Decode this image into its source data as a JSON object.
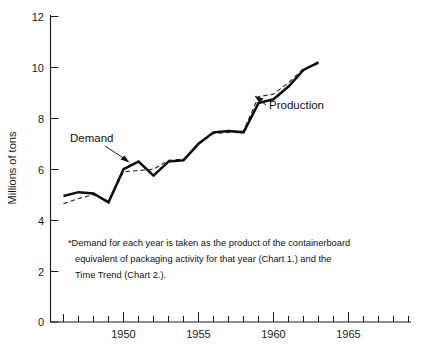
{
  "chart_data": {
    "type": "line",
    "title": "",
    "xlabel": "",
    "ylabel": "Millions of tons",
    "xlim": [
      1946,
      1969
    ],
    "ylim": [
      0,
      12
    ],
    "y_ticks": [
      0,
      2,
      4,
      6,
      8,
      10,
      12
    ],
    "y_tick_labels": [
      "0",
      "2",
      "4",
      "6",
      "8",
      "10",
      "12"
    ],
    "x_ticks": [
      1946,
      1947,
      1948,
      1949,
      1950,
      1951,
      1952,
      1953,
      1954,
      1955,
      1956,
      1957,
      1958,
      1959,
      1960,
      1961,
      1962,
      1963,
      1964,
      1965,
      1966,
      1967,
      1968,
      1969
    ],
    "x_tick_labels_shown": [
      "1950",
      "1955",
      "1960",
      "1965"
    ],
    "x_labeled_ticks": [
      1950,
      1955,
      1960,
      1965
    ],
    "grid": false,
    "legend": "inline-annotations",
    "x": [
      1946,
      1947,
      1948,
      1949,
      1950,
      1951,
      1952,
      1953,
      1954,
      1955,
      1956,
      1957,
      1958,
      1959,
      1960,
      1961,
      1962,
      1963
    ],
    "series": [
      {
        "name": "Production",
        "style": "solid",
        "color": "#0d0d0d",
        "values": [
          4.95,
          5.1,
          5.05,
          4.7,
          6.0,
          6.3,
          5.75,
          6.3,
          6.35,
          7.0,
          7.45,
          7.5,
          7.45,
          8.6,
          8.75,
          9.25,
          9.9,
          10.2
        ]
      },
      {
        "name": "Demand",
        "style": "dashed",
        "color": "#2a2a2a",
        "values": [
          4.65,
          4.85,
          5.0,
          4.75,
          5.9,
          5.95,
          6.0,
          6.35,
          6.4,
          7.0,
          7.4,
          7.45,
          7.5,
          8.85,
          8.95,
          9.4,
          9.95,
          10.15
        ]
      }
    ],
    "annotations": [
      {
        "text": "Demand",
        "points_to": "demand-series"
      },
      {
        "text": "Production",
        "points_to": "production-series"
      }
    ]
  },
  "axis": {
    "y_title": "Millions of tons",
    "y_labels": [
      "12",
      "10",
      "8",
      "6",
      "4",
      "2",
      "0"
    ],
    "x_labels": [
      "1950",
      "1955",
      "1960",
      "1965"
    ]
  },
  "labels": {
    "demand": "Demand",
    "production": "Production"
  },
  "footnote": {
    "line1": "*Demand for each year is taken as the product of the containerboard",
    "line2": "equivalent of packaging activity for that year (Chart 1.) and the",
    "line3": "Time Trend (Chart 2.)."
  }
}
